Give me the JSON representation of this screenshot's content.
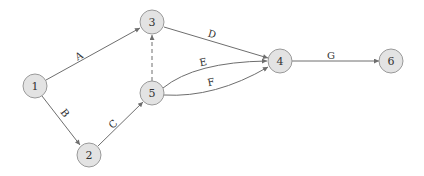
{
  "diagram": {
    "type": "activity-on-arrow network",
    "colors": {
      "node_fill": "#e3e3e3",
      "node_stroke": "#9a9a9a",
      "edge": "#6e6e6e",
      "text": "#333333"
    },
    "nodes": [
      {
        "id": "1",
        "label": "1",
        "x": 35,
        "y": 86
      },
      {
        "id": "2",
        "label": "2",
        "x": 89,
        "y": 155
      },
      {
        "id": "3",
        "label": "3",
        "x": 152,
        "y": 22
      },
      {
        "id": "4",
        "label": "4",
        "x": 280,
        "y": 61
      },
      {
        "id": "5",
        "label": "5",
        "x": 152,
        "y": 93
      },
      {
        "id": "6",
        "label": "6",
        "x": 391,
        "y": 61
      }
    ],
    "edges": [
      {
        "id": "A",
        "label": "A",
        "from": "1",
        "to": "3",
        "style": "solid"
      },
      {
        "id": "B",
        "label": "B",
        "from": "1",
        "to": "2",
        "style": "solid"
      },
      {
        "id": "C",
        "label": "C",
        "from": "2",
        "to": "5",
        "style": "solid"
      },
      {
        "id": "D",
        "label": "D",
        "from": "3",
        "to": "4",
        "style": "solid"
      },
      {
        "id": "E",
        "label": "E",
        "from": "5",
        "to": "4",
        "style": "solid"
      },
      {
        "id": "F",
        "label": "F",
        "from": "5",
        "to": "4",
        "style": "solid"
      },
      {
        "id": "G",
        "label": "G",
        "from": "4",
        "to": "6",
        "style": "solid"
      },
      {
        "id": "dummy",
        "label": "",
        "from": "5",
        "to": "3",
        "style": "dashed"
      }
    ]
  }
}
